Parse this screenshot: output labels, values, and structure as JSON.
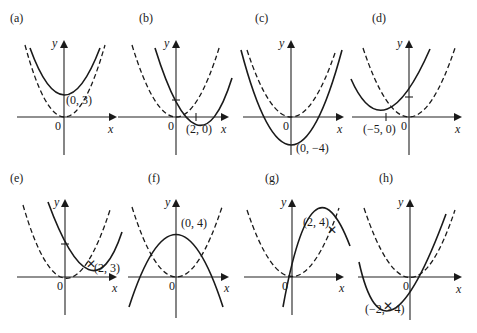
{
  "figure": {
    "panels": [
      {
        "id": "a",
        "label": "(a)",
        "point_label": "(0, 3)",
        "origin_label": "0",
        "x_label": "x",
        "y_label": "y",
        "description": "y = x^2 + 3 (solid) vs y = x^2 (dashed)"
      },
      {
        "id": "b",
        "label": "(b)",
        "point_label": "(2, 0)",
        "origin_label": "0",
        "x_label": "x",
        "y_label": "y",
        "description": "y = (x-2)^2 (solid) vs y = x^2 (dashed)"
      },
      {
        "id": "c",
        "label": "(c)",
        "point_label": "(0, −4)",
        "origin_label": "0",
        "x_label": "x",
        "y_label": "y",
        "description": "y = x^2 - 4 (solid) vs y = x^2 (dashed)"
      },
      {
        "id": "d",
        "label": "(d)",
        "point_label": "(−5, 0)",
        "origin_label": "0",
        "x_label": "x",
        "y_label": "y",
        "description": "y = (x+5)^2 (solid) vs y = x^2 (dashed)"
      },
      {
        "id": "e",
        "label": "(e)",
        "point_label": "(2, 3)",
        "origin_label": "0",
        "x_label": "x",
        "y_label": "y",
        "description": "y = (x-2)^2 + 3 (solid) vs y = x^2 (dashed)"
      },
      {
        "id": "f",
        "label": "(f)",
        "point_label": "(0, 4)",
        "origin_label": "0",
        "x_label": "x",
        "y_label": "y",
        "description": "y = 4 - x^2 (solid) vs y = x^2 (dashed)"
      },
      {
        "id": "g",
        "label": "(g)",
        "point_label": "(2, 4)",
        "origin_label": "0",
        "x_label": "x",
        "y_label": "y",
        "description": "y = 4 - (x-2)^2 (solid) vs y = x^2 (dashed)"
      },
      {
        "id": "h",
        "label": "(h)",
        "point_label": "(−2, −4)",
        "origin_label": "0",
        "x_label": "x",
        "y_label": "y",
        "description": "y = (x+2)^2 - 4 (solid) vs y = x^2 (dashed)"
      }
    ],
    "legend": {
      "solid": "transformed parabola",
      "dashed": "y = x²"
    }
  }
}
